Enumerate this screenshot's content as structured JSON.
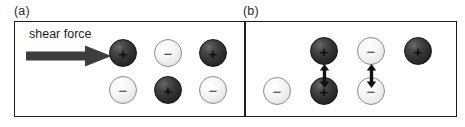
{
  "figure": {
    "width": 465,
    "height": 127,
    "background_color": "#ffffff",
    "frame_color": "#1d1d1d"
  },
  "panels": [
    {
      "id": "a",
      "caption": "(a)",
      "annotation": {
        "label": "shear force",
        "arrow": "right-arrow",
        "arrow_color": "#3d3d3d",
        "direction": "right"
      },
      "lattice": {
        "description": "aligned lattice of alternating charges under shear",
        "rows": [
          {
            "row": "top",
            "ions": [
              {
                "charge": "+",
                "color": "dark",
                "x": 108,
                "y": 38
              },
              {
                "charge": "−",
                "color": "light",
                "x": 153,
                "y": 38
              },
              {
                "charge": "+",
                "color": "dark",
                "x": 198,
                "y": 38
              }
            ]
          },
          {
            "row": "bottom",
            "ions": [
              {
                "charge": "−",
                "color": "light",
                "x": 108,
                "y": 75
              },
              {
                "charge": "+",
                "color": "dark",
                "x": 153,
                "y": 75
              },
              {
                "charge": "−",
                "color": "light",
                "x": 198,
                "y": 75
              }
            ]
          }
        ]
      }
    },
    {
      "id": "b",
      "caption": "(b)",
      "lattice": {
        "description": "displaced lattice: like charges face each other and repel",
        "rows": [
          {
            "row": "top",
            "ions": [
              {
                "charge": "+",
                "color": "dark",
                "x": 311,
                "y": 38
              },
              {
                "charge": "−",
                "color": "light",
                "x": 358,
                "y": 38
              },
              {
                "charge": "+",
                "color": "dark",
                "x": 405,
                "y": 38
              }
            ]
          },
          {
            "row": "bottom",
            "ions": [
              {
                "charge": "−",
                "color": "light",
                "x": 264,
                "y": 75
              },
              {
                "charge": "+",
                "color": "dark",
                "x": 311,
                "y": 75
              },
              {
                "charge": "−",
                "color": "light",
                "x": 358,
                "y": 75
              }
            ]
          }
        ],
        "repulsion_arrows": [
          {
            "between": "dark-pair",
            "x": 320,
            "y": 63,
            "type": "double-headed-vertical"
          },
          {
            "between": "light-pair",
            "x": 367,
            "y": 63,
            "type": "double-headed-vertical"
          }
        ]
      }
    }
  ],
  "symbols": {
    "positive": "+",
    "negative": "−"
  }
}
